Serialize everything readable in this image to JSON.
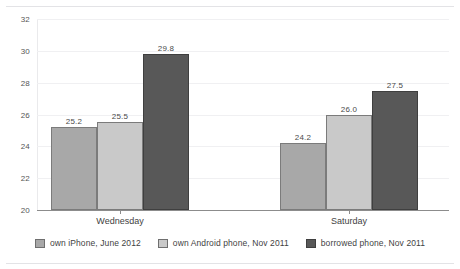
{
  "chart_data": {
    "type": "bar",
    "title": "",
    "subtitle": "",
    "xlabel": "",
    "ylabel": "",
    "categories": [
      "Wednesday",
      "Saturday"
    ],
    "series": [
      {
        "name": "own iPhone, June 2012",
        "color": "#a8a8a8",
        "values": [
          25.2,
          25.5
        ],
        "labels": [
          "25.2",
          "24.2"
        ]
      },
      {
        "name": "own Android phone, Nov 2011",
        "color": "#c9c9c9",
        "values": [
          25.5,
          26.0
        ],
        "labels": [
          "25.5",
          "26.0"
        ]
      },
      {
        "name": "borrowed phone, Nov 2011",
        "color": "#585858",
        "values": [
          29.8,
          27.5
        ],
        "labels": [
          "29.8",
          "27.5"
        ]
      }
    ],
    "grouped_values": {
      "Wednesday": [
        25.2,
        25.5,
        29.8
      ],
      "Saturday": [
        24.2,
        26.0,
        27.5
      ]
    },
    "data_labels": [
      "25.2",
      "25.5",
      "29.8",
      "24.2",
      "26.0",
      "27.5"
    ],
    "ylim": [
      20,
      32
    ],
    "yticks": [
      20,
      22,
      24,
      26,
      28,
      30,
      32
    ],
    "ytick_labels": [
      "20",
      "22",
      "24",
      "26",
      "28",
      "30",
      "32"
    ],
    "grid": true,
    "grid_axis": "y",
    "legend_position": "bottom"
  },
  "legend": {
    "items": [
      {
        "label": "own iPhone, June 2012"
      },
      {
        "label": "own Android phone, Nov 2011"
      },
      {
        "label": "borrowed phone, Nov 2011"
      }
    ]
  }
}
